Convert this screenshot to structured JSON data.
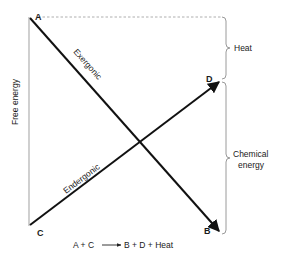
{
  "diagram": {
    "type": "energy-diagram",
    "y_axis_label": "Free energy",
    "points": {
      "A": "A",
      "B": "B",
      "C": "C",
      "D": "D"
    },
    "lines": {
      "exergonic": "Exergonic",
      "endergonic": "Endergonic"
    },
    "braces": {
      "heat": "Heat",
      "chemical_line1": "Chemical",
      "chemical_line2": "energy"
    },
    "equation": "A + C ──▶ B + D + Heat",
    "equation_parts": {
      "left": "A + C",
      "right": "B + D + Heat"
    },
    "colors": {
      "line": "#111111",
      "axis": "#aaaaaa",
      "brace": "#999999",
      "dashed": "#999999"
    }
  }
}
